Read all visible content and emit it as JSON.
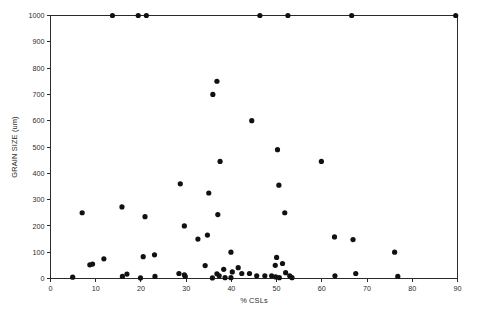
{
  "chart_data": {
    "type": "scatter",
    "title": "",
    "xlabel": "% CSLs",
    "ylabel": "GRAIN SIZE (um)",
    "xlim": [
      0,
      90
    ],
    "ylim": [
      0,
      1000
    ],
    "xticks": [
      0,
      10,
      20,
      30,
      40,
      50,
      60,
      70,
      80,
      90
    ],
    "yticks": [
      0,
      100,
      200,
      300,
      400,
      500,
      600,
      700,
      800,
      900,
      1000
    ],
    "xtick_labels": [
      "0",
      "10",
      "20",
      "30",
      "40",
      "50",
      "60",
      "70",
      "80",
      "90"
    ],
    "ytick_labels": [
      "0",
      "100",
      "200",
      "300",
      "400",
      "500",
      "600",
      "700",
      "800",
      "900",
      "1000"
    ],
    "grid": false,
    "legend": null,
    "marker": "filled-circle",
    "marker_color": "#111111",
    "marker_size": 3,
    "series": [
      {
        "name": "samples",
        "points": [
          [
            13.7,
            1000
          ],
          [
            19.4,
            1000
          ],
          [
            21.2,
            1000
          ],
          [
            46.3,
            1000
          ],
          [
            52.5,
            1000
          ],
          [
            66.6,
            1000
          ],
          [
            89.6,
            1000
          ],
          [
            36.8,
            750
          ],
          [
            35.9,
            700
          ],
          [
            44.5,
            600
          ],
          [
            50.2,
            490
          ],
          [
            37.5,
            445
          ],
          [
            59.9,
            445
          ],
          [
            28.7,
            360
          ],
          [
            35.0,
            325
          ],
          [
            50.5,
            355
          ],
          [
            7.0,
            250
          ],
          [
            15.8,
            272
          ],
          [
            20.9,
            235
          ],
          [
            37.0,
            243
          ],
          [
            51.8,
            250
          ],
          [
            29.6,
            200
          ],
          [
            34.7,
            165
          ],
          [
            32.6,
            150
          ],
          [
            62.8,
            158
          ],
          [
            66.9,
            148
          ],
          [
            76.1,
            100
          ],
          [
            39.9,
            100
          ],
          [
            23.0,
            90
          ],
          [
            20.5,
            83
          ],
          [
            11.8,
            75
          ],
          [
            50.0,
            80
          ],
          [
            8.7,
            52
          ],
          [
            9.3,
            55
          ],
          [
            34.2,
            49
          ],
          [
            41.5,
            41
          ],
          [
            49.7,
            50
          ],
          [
            51.3,
            57
          ],
          [
            38.3,
            35
          ],
          [
            40.2,
            25
          ],
          [
            52.0,
            22
          ],
          [
            29.6,
            14
          ],
          [
            29.8,
            8
          ],
          [
            36.8,
            18
          ],
          [
            37.3,
            10
          ],
          [
            42.3,
            19
          ],
          [
            44.0,
            19
          ],
          [
            28.4,
            19
          ],
          [
            16.9,
            17
          ],
          [
            15.9,
            8
          ],
          [
            23.1,
            8
          ],
          [
            4.9,
            5
          ],
          [
            19.9,
            2
          ],
          [
            35.8,
            2
          ],
          [
            38.6,
            3
          ],
          [
            45.6,
            10
          ],
          [
            47.4,
            10
          ],
          [
            48.9,
            10
          ],
          [
            49.8,
            6
          ],
          [
            50.6,
            3
          ],
          [
            52.9,
            10
          ],
          [
            53.4,
            3
          ],
          [
            39.9,
            3
          ],
          [
            62.9,
            10
          ],
          [
            67.5,
            19
          ],
          [
            76.8,
            8
          ]
        ]
      }
    ]
  },
  "axes": {
    "x_axis_name": "% CSLs",
    "y_axis_name": "GRAIN SIZE (um)"
  }
}
